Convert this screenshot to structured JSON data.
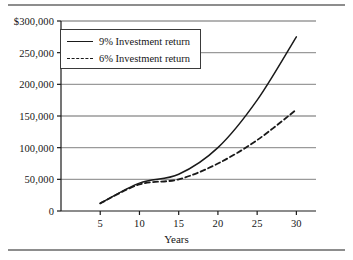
{
  "chart_data": {
    "type": "line",
    "title": "",
    "subtitle": "",
    "xlabel": "Years",
    "ylabel": "",
    "x": [
      5,
      10,
      15,
      20,
      25,
      30
    ],
    "xlim": [
      0,
      32.5
    ],
    "ylim": [
      0,
      300000
    ],
    "grid": "horizontal",
    "legend_position": "upper-left",
    "series": [
      {
        "name": "9% Investment return",
        "style": "solid",
        "values": [
          12000,
          44000,
          58000,
          100000,
          175000,
          275000
        ]
      },
      {
        "name": "6% Investment return",
        "style": "dashed",
        "values": [
          12000,
          42000,
          50000,
          75000,
          112000,
          160000
        ]
      }
    ],
    "y_tick_labels": [
      "0",
      "50,000",
      "100,000",
      "150,000",
      "200,000",
      "250,000",
      "$300,000"
    ],
    "y_tick_values": [
      0,
      50000,
      100000,
      150000,
      200000,
      250000,
      300000
    ],
    "x_tick_labels": [
      "5",
      "10",
      "15",
      "20",
      "25",
      "30"
    ],
    "x_tick_values": [
      5,
      10,
      15,
      20,
      25,
      30
    ],
    "colors": {
      "series_line": "#1a1a1a",
      "gridline": "#9a9a9a",
      "axis": "#1a1a1a",
      "background": "#ffffff",
      "rule": "#8d8d8d"
    }
  },
  "legend": {
    "items": [
      {
        "label": "9% Investment return"
      },
      {
        "label": "6% Investment return"
      }
    ]
  },
  "axes": {
    "x_title": "Years",
    "y_labels": [
      "$300,000",
      "250,000",
      "200,000",
      "150,000",
      "100,000",
      "50,000",
      "0"
    ],
    "x_labels": [
      "5",
      "10",
      "15",
      "20",
      "25",
      "30"
    ]
  }
}
